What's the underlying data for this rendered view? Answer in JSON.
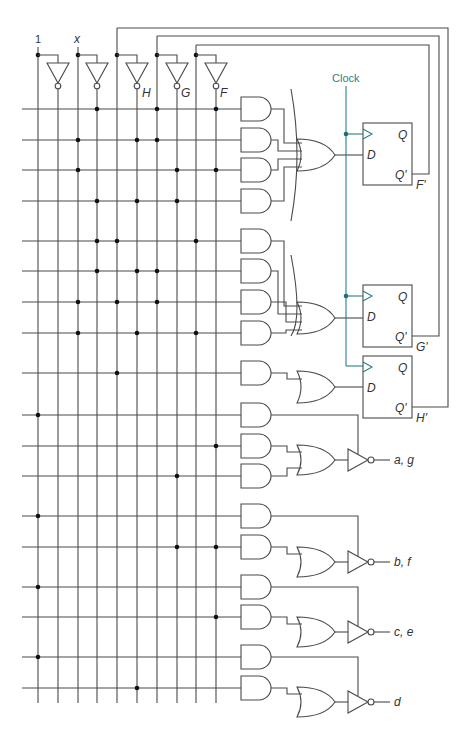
{
  "diagram": {
    "inputs": [
      {
        "label": "1",
        "x": 38
      },
      {
        "label": "x",
        "x": 78
      }
    ],
    "state_vars": [
      {
        "label": "H",
        "x": 117,
        "loop_y": 28,
        "loop_x": 448
      },
      {
        "label": "G",
        "x": 157,
        "loop_y": 36,
        "loop_x": 439
      },
      {
        "label": "F",
        "x": 196,
        "loop_y": 45,
        "loop_x": 429
      }
    ],
    "bus_x": [
      38,
      58,
      78,
      97,
      117,
      137,
      157,
      177,
      196,
      216
    ],
    "clock": {
      "label": "Clock",
      "x": 346,
      "color": "#2a7f86"
    },
    "flipflops": [
      {
        "name": "F",
        "q_label": "Q",
        "d_label": "D",
        "qn_label": "Q'",
        "out_label": "F'",
        "top": 123
      },
      {
        "name": "G",
        "q_label": "Q",
        "d_label": "D",
        "qn_label": "Q'",
        "out_label": "G'",
        "top": 285
      },
      {
        "name": "H",
        "q_label": "Q",
        "d_label": "D",
        "qn_label": "Q'",
        "out_label": "H'",
        "top": 356
      }
    ],
    "and_rows": [
      {
        "y": 109,
        "dots": [
          97,
          157,
          216
        ]
      },
      {
        "y": 140,
        "dots": [
          78,
          137,
          157
        ]
      },
      {
        "y": 170,
        "dots": [
          78,
          177,
          216
        ]
      },
      {
        "y": 201,
        "dots": [
          97,
          137,
          177
        ]
      },
      {
        "y": 241,
        "dots": [
          97,
          117,
          196
        ]
      },
      {
        "y": 271,
        "dots": [
          97,
          137,
          157
        ]
      },
      {
        "y": 302,
        "dots": [
          78,
          117,
          157
        ]
      },
      {
        "y": 333,
        "dots": [
          78,
          137,
          196
        ]
      },
      {
        "y": 373,
        "dots": [
          117
        ]
      },
      {
        "y": 415,
        "dots": [
          38
        ]
      },
      {
        "y": 446,
        "dots": [
          216
        ]
      },
      {
        "y": 476,
        "dots": [
          177
        ]
      },
      {
        "y": 516,
        "dots": [
          38
        ]
      },
      {
        "y": 547,
        "dots": [
          177,
          216
        ]
      },
      {
        "y": 587,
        "dots": [
          38
        ]
      },
      {
        "y": 617,
        "dots": [
          216
        ]
      },
      {
        "y": 657,
        "dots": [
          38
        ]
      },
      {
        "y": 688,
        "dots": [
          137
        ]
      }
    ],
    "outputs": [
      {
        "label": "a, g",
        "y": 460
      },
      {
        "label": "b, f",
        "y": 562
      },
      {
        "label": "c, e",
        "y": 632
      },
      {
        "label": "d",
        "y": 702
      }
    ]
  }
}
